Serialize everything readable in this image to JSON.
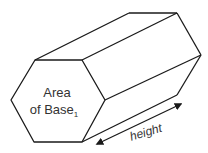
{
  "diagram": {
    "type": "hexagonal-prism",
    "base_label": {
      "line1": "Area",
      "line2": "of Base",
      "subscript": "1"
    },
    "dimension_label": "height",
    "colors": {
      "stroke": "#1a1a1a",
      "text": "#333333",
      "background": "#ffffff"
    }
  }
}
